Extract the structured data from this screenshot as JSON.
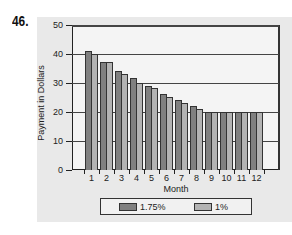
{
  "question_number": "46.",
  "chart_data": {
    "type": "bar",
    "title": "",
    "xlabel": "Month",
    "ylabel": "Payment in Dollars",
    "categories": [
      "1",
      "2",
      "3",
      "4",
      "5",
      "6",
      "7",
      "8",
      "9",
      "10",
      "11",
      "12"
    ],
    "series": [
      {
        "name": "1.75%",
        "color": "#808080",
        "values": [
          41,
          37.2,
          34,
          31.7,
          29,
          26.2,
          24.1,
          22,
          20,
          20,
          20,
          20
        ]
      },
      {
        "name": "1%",
        "color": "#b3b3b3",
        "values": [
          40,
          37.2,
          33,
          30,
          28.3,
          25.2,
          23.1,
          21,
          20,
          20,
          20,
          20
        ]
      }
    ],
    "ylim": [
      0,
      50
    ],
    "yticks": [
      "0",
      "10",
      "20",
      "30",
      "40",
      "50"
    ],
    "grid": true,
    "legend_position": "bottom"
  }
}
